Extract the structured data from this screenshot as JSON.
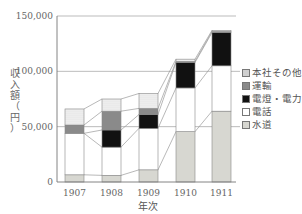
{
  "chart_data": {
    "type": "bar",
    "stacked": true,
    "title": "",
    "xlabel": "年次",
    "ylabel": "収入額（円）",
    "ylim": [
      0,
      150000
    ],
    "yticks": [
      "0",
      "50,000",
      "100,000",
      "150,000"
    ],
    "categories": [
      "1907",
      "1908",
      "1909",
      "1910",
      "1911"
    ],
    "series": [
      {
        "name": "水道",
        "pattern": "light-gray",
        "values": [
          6500,
          6000,
          11000,
          45500,
          64000
        ]
      },
      {
        "name": "電話",
        "pattern": "white",
        "values": [
          37500,
          25500,
          37500,
          39500,
          41000
        ]
      },
      {
        "name": "電燈・電力",
        "pattern": "black",
        "values": [
          0,
          15500,
          12500,
          23000,
          30000
        ]
      },
      {
        "name": "運輸",
        "pattern": "gray",
        "values": [
          7500,
          17000,
          5500,
          1000,
          1000
        ]
      },
      {
        "name": "本社その他",
        "pattern": "dots",
        "values": [
          14500,
          11000,
          13500,
          2000,
          1000
        ]
      }
    ],
    "totals": [
      66000,
      75000,
      80000,
      111000,
      137000
    ],
    "grid": {
      "horizontal": true,
      "at": [
        50000,
        100000
      ]
    },
    "connector_lines": true,
    "legend_position": "right",
    "legend_order": [
      "本社その他",
      "運輸",
      "電燈・電力",
      "電話",
      "水道"
    ]
  },
  "axis": {
    "y_label_chars": [
      "収",
      "入",
      "額",
      "（",
      "円",
      "）"
    ],
    "x_label": "年次",
    "y_ticks": [
      "150,000",
      "100,000",
      "50,000",
      "0"
    ],
    "x_ticks": [
      "1907",
      "1908",
      "1909",
      "1910",
      "1911"
    ]
  },
  "legend": [
    {
      "label": "本社その他",
      "cls": "sw-dots"
    },
    {
      "label": "運輸",
      "cls": "sw-gray"
    },
    {
      "label": "電燈・電力",
      "cls": "sw-black"
    },
    {
      "label": "電話",
      "cls": "sw-white"
    },
    {
      "label": "水道",
      "cls": "sw-light"
    }
  ]
}
